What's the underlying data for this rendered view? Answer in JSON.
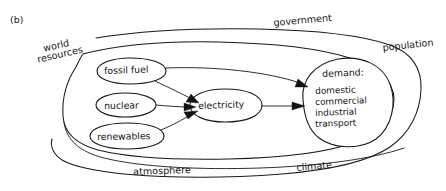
{
  "figure": {
    "label": "(b)",
    "type": "system-influence-diagram"
  },
  "boundaries": [
    {
      "id": "outer",
      "label": "government"
    },
    {
      "id": "outer2",
      "label": "population"
    },
    {
      "id": "outer3",
      "label": "climate"
    },
    {
      "id": "inner",
      "label": "world resources"
    },
    {
      "id": "inner2",
      "label": "atmosphere"
    }
  ],
  "boundary_labels": {
    "world_resources_line1": "world",
    "world_resources_line2": "resources",
    "government": "government",
    "population": "population",
    "atmosphere": "atmosphere",
    "climate": "climate"
  },
  "nodes": [
    {
      "id": "fossil-fuel",
      "label": "fossil fuel"
    },
    {
      "id": "nuclear",
      "label": "nuclear"
    },
    {
      "id": "renewables",
      "label": "renewables"
    },
    {
      "id": "electricity",
      "label": "electricity"
    },
    {
      "id": "demand",
      "label": "demand:"
    }
  ],
  "demand_items": [
    "domestic",
    "commercial",
    "industrial",
    "transport"
  ],
  "edges": [
    {
      "from": "fossil-fuel",
      "to": "electricity"
    },
    {
      "from": "fossil-fuel",
      "to": "demand"
    },
    {
      "from": "nuclear",
      "to": "electricity"
    },
    {
      "from": "renewables",
      "to": "electricity"
    },
    {
      "from": "electricity",
      "to": "demand"
    }
  ],
  "colors": {
    "ink": "#1a1a1a",
    "paper": "#ffffff"
  }
}
